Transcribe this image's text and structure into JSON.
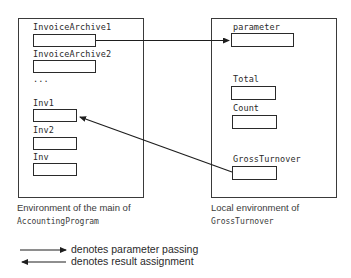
{
  "main_environment": {
    "caption_line1": "Environment of the main of",
    "caption_line2": "AccountingProgram",
    "variables": [
      {
        "name": "InvoiceArchive1"
      },
      {
        "name": "InvoiceArchive2"
      },
      {
        "name": "..."
      },
      {
        "name": "Inv1"
      },
      {
        "name": "Inv2"
      },
      {
        "name": "Inv"
      }
    ]
  },
  "local_environment": {
    "caption_line1": "Local environment of",
    "caption_line2": "GrossTurnover",
    "variables": [
      {
        "name": "parameter"
      },
      {
        "name": "Total"
      },
      {
        "name": "Count"
      },
      {
        "name": "GrossTurnover"
      }
    ]
  },
  "connections": [
    {
      "from": "InvoiceArchive1",
      "to": "parameter",
      "kind": "parameter passing"
    },
    {
      "from": "GrossTurnover",
      "to": "Inv1",
      "kind": "result assignment"
    }
  ],
  "legend": {
    "items": [
      {
        "arrow": "right-arrow",
        "label": "denotes parameter passing"
      },
      {
        "arrow": "left-arrow",
        "label": "denotes result assignment"
      }
    ]
  },
  "colors": {
    "line": "#2a2a2a",
    "text": "#2a2a2a",
    "background": "#ffffff"
  }
}
